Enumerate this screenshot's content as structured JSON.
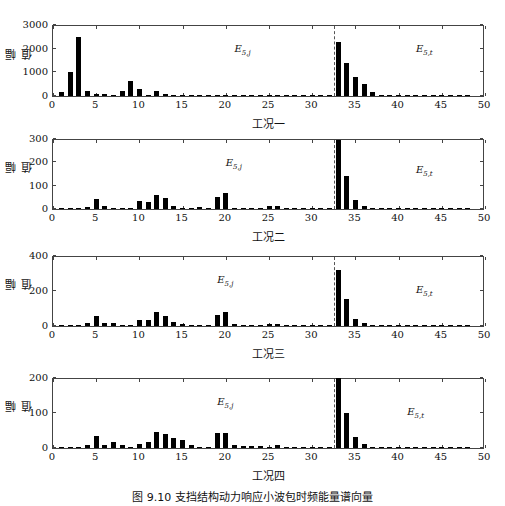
{
  "figure": {
    "caption": "图 9.10   支挡结构动力响应小波包时频能量谱向量"
  },
  "chart_data": [
    {
      "type": "bar",
      "title": "",
      "xlabel": "工况一",
      "ylabel": "幅值",
      "xlim": [
        0,
        50
      ],
      "ylim": [
        0,
        3000
      ],
      "xticks": [
        0,
        5,
        10,
        15,
        20,
        25,
        30,
        35,
        40,
        45,
        50
      ],
      "yticks": [
        0,
        1000,
        2000,
        3000
      ],
      "divider_x": 32.5,
      "annotations": [
        {
          "text": "E",
          "sub": "5,j",
          "x": 21,
          "y_frac": 0.55
        },
        {
          "text": "E",
          "sub": "5,t",
          "x": 42,
          "y_frac": 0.55
        }
      ],
      "x": [
        1,
        2,
        3,
        4,
        5,
        6,
        7,
        8,
        9,
        10,
        11,
        12,
        13,
        14,
        15,
        16,
        17,
        18,
        19,
        20,
        21,
        22,
        23,
        24,
        25,
        26,
        27,
        28,
        29,
        30,
        31,
        32,
        33,
        34,
        35,
        36,
        37,
        38,
        39,
        40,
        41,
        42,
        43,
        44,
        45,
        46,
        47,
        48
      ],
      "values": [
        150,
        1000,
        2500,
        220,
        80,
        70,
        30,
        220,
        650,
        300,
        20,
        220,
        100,
        30,
        20,
        20,
        15,
        15,
        15,
        20,
        15,
        15,
        15,
        15,
        15,
        15,
        15,
        15,
        15,
        15,
        15,
        15,
        2300,
        1400,
        800,
        500,
        150,
        30,
        15,
        15,
        15,
        15,
        15,
        15,
        15,
        15,
        15,
        15
      ]
    },
    {
      "type": "bar",
      "title": "",
      "xlabel": "工况二",
      "ylabel": "幅值",
      "xlim": [
        0,
        50
      ],
      "ylim": [
        0,
        300
      ],
      "xticks": [
        0,
        5,
        10,
        15,
        20,
        25,
        30,
        35,
        40,
        45,
        50
      ],
      "yticks": [
        0,
        100,
        200,
        300
      ],
      "divider_x": 32.5,
      "annotations": [
        {
          "text": "E",
          "sub": "5,j",
          "x": 20,
          "y_frac": 0.55
        },
        {
          "text": "E",
          "sub": "5,t",
          "x": 42,
          "y_frac": 0.45
        }
      ],
      "x": [
        1,
        2,
        3,
        4,
        5,
        6,
        7,
        8,
        9,
        10,
        11,
        12,
        13,
        14,
        15,
        16,
        17,
        18,
        19,
        20,
        21,
        22,
        23,
        24,
        25,
        26,
        27,
        28,
        29,
        30,
        31,
        32,
        33,
        34,
        35,
        36,
        37,
        38,
        39,
        40,
        41,
        42,
        43,
        44,
        45,
        46,
        47,
        48
      ],
      "values": [
        1,
        1,
        3,
        8,
        45,
        15,
        2,
        2,
        2,
        35,
        30,
        60,
        48,
        15,
        5,
        1,
        8,
        2,
        50,
        68,
        5,
        3,
        2,
        2,
        12,
        12,
        2,
        2,
        2,
        2,
        2,
        2,
        295,
        140,
        38,
        12,
        6,
        3,
        2,
        2,
        2,
        2,
        2,
        2,
        2,
        2,
        2,
        2
      ]
    },
    {
      "type": "bar",
      "title": "",
      "xlabel": "工况三",
      "ylabel": "幅值",
      "xlim": [
        0,
        50
      ],
      "ylim": [
        0,
        400
      ],
      "xticks": [
        0,
        5,
        10,
        15,
        20,
        25,
        30,
        35,
        40,
        45,
        50
      ],
      "yticks": [
        0,
        200,
        400
      ],
      "divider_x": 32.5,
      "annotations": [
        {
          "text": "E",
          "sub": "5,j",
          "x": 19,
          "y_frac": 0.55
        },
        {
          "text": "E",
          "sub": "5,t",
          "x": 42,
          "y_frac": 0.4
        }
      ],
      "x": [
        1,
        2,
        3,
        4,
        5,
        6,
        7,
        8,
        9,
        10,
        11,
        12,
        13,
        14,
        15,
        16,
        17,
        18,
        19,
        20,
        21,
        22,
        23,
        24,
        25,
        26,
        27,
        28,
        29,
        30,
        31,
        32,
        33,
        34,
        35,
        36,
        37,
        38,
        39,
        40,
        41,
        42,
        43,
        44,
        45,
        46,
        47,
        48
      ],
      "values": [
        3,
        3,
        3,
        20,
        60,
        20,
        15,
        3,
        3,
        35,
        35,
        80,
        60,
        25,
        10,
        3,
        5,
        3,
        65,
        80,
        10,
        8,
        5,
        3,
        12,
        12,
        3,
        3,
        3,
        3,
        3,
        3,
        320,
        155,
        40,
        15,
        5,
        3,
        3,
        3,
        3,
        3,
        3,
        3,
        3,
        3,
        3,
        3
      ]
    },
    {
      "type": "bar",
      "title": "",
      "xlabel": "工况四",
      "ylabel": "幅值",
      "xlim": [
        0,
        50
      ],
      "ylim": [
        0,
        200
      ],
      "xticks": [
        0,
        5,
        10,
        15,
        20,
        25,
        30,
        35,
        40,
        45,
        50
      ],
      "yticks": [
        0,
        100,
        200
      ],
      "divider_x": 32.5,
      "annotations": [
        {
          "text": "E",
          "sub": "5,j",
          "x": 19,
          "y_frac": 0.55
        },
        {
          "text": "E",
          "sub": "5,t",
          "x": 41,
          "y_frac": 0.4
        }
      ],
      "x": [
        1,
        2,
        3,
        4,
        5,
        6,
        7,
        8,
        9,
        10,
        11,
        12,
        13,
        14,
        15,
        16,
        17,
        18,
        19,
        20,
        21,
        22,
        23,
        24,
        25,
        26,
        27,
        28,
        29,
        30,
        31,
        32,
        33,
        34,
        35,
        36,
        37,
        38,
        39,
        40,
        41,
        42,
        43,
        44,
        45,
        46,
        47,
        48
      ],
      "values": [
        3,
        3,
        3,
        8,
        35,
        10,
        18,
        10,
        2,
        12,
        18,
        45,
        40,
        30,
        22,
        10,
        2,
        2,
        42,
        44,
        8,
        7,
        7,
        5,
        2,
        10,
        2,
        2,
        2,
        2,
        2,
        2,
        200,
        100,
        32,
        12,
        4,
        4,
        3,
        2,
        2,
        2,
        2,
        2,
        2,
        2,
        2,
        2
      ]
    }
  ]
}
